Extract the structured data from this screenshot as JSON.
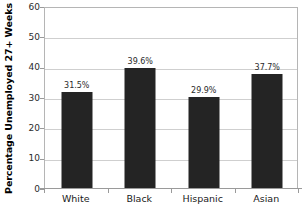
{
  "chart_data": {
    "type": "bar",
    "title": "",
    "xlabel": "",
    "ylabel": "Percentage Unemployed 27+ Weeks",
    "categories": [
      "White",
      "Black",
      "Hispanic",
      "Asian"
    ],
    "values": [
      31.5,
      39.6,
      29.9,
      37.7
    ],
    "value_labels": [
      "31.5%",
      "39.6%",
      "29.9%",
      "37.7%"
    ],
    "ylim": [
      0,
      60
    ],
    "ytick_labels": [
      "60",
      "50",
      "40",
      "30",
      "20",
      "10",
      "0"
    ],
    "ytick_values": [
      60,
      50,
      40,
      30,
      20,
      10,
      0
    ],
    "grid": "horizontal",
    "legend": "none",
    "bar_color": "#242424",
    "gridline_color": "#cfcfcf",
    "frame_color": "#b5b5b5",
    "background_color": "#ffffff"
  }
}
